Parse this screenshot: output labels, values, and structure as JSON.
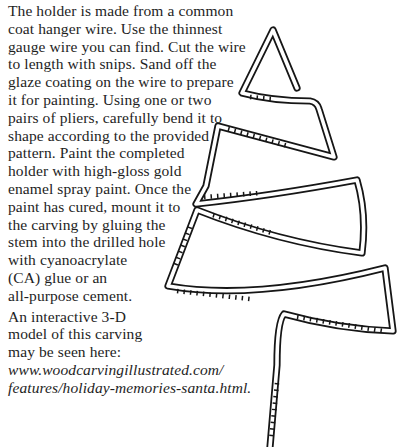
{
  "page": {
    "background_color": "#ffffff",
    "ink_color": "#1e1e1e"
  },
  "article": {
    "para1_lines": [
      "The holder is made from a common",
      "coat hanger wire. Use the thinnest",
      "gauge wire you can find. Cut the wire",
      "to length with snips. Sand off the",
      "glaze coating on the wire to prepare",
      "it for painting. Using one or two",
      "pairs of pliers, carefully bend it to",
      "shape according to the provided",
      "pattern. Paint the completed",
      "holder with high-gloss gold",
      "enamel spray paint. Once the",
      "paint has cured, mount it to",
      "the carving by gluing the",
      "stem into the drilled hole",
      "with cyanoacrylate",
      "(CA) glue or an",
      "all-purpose cement."
    ],
    "para2_lines": [
      "An interactive 3-D",
      "model of this carving",
      "may be seen here:"
    ],
    "url_lines": [
      "www.woodcarvingillustrated.com/",
      "features/holiday-memories-santa.html."
    ]
  },
  "illustration": {
    "name": "wire-ornament-holder-pattern",
    "description": "Hand-drawn bending pattern of a coat-hanger wire tree-shaped holder with stem",
    "stroke_color": "#161616"
  }
}
